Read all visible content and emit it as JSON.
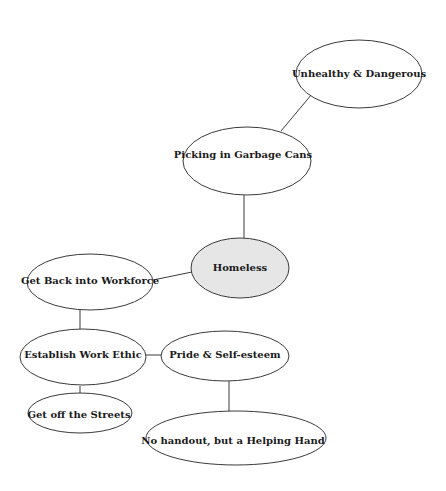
{
  "diagram": {
    "type": "concept-map",
    "nodes": [
      {
        "id": "unhealthy",
        "label": "Unhealthy & Dangerous"
      },
      {
        "id": "picking",
        "label": "Picking in Garbage Cans"
      },
      {
        "id": "homeless",
        "label": "Homeless",
        "central": true,
        "fill": "#e6e6e6"
      },
      {
        "id": "workforce",
        "label": "Get Back into Workforce"
      },
      {
        "id": "ethic",
        "label": "Establish Work Ethic"
      },
      {
        "id": "pride",
        "label": "Pride & Self-esteem"
      },
      {
        "id": "streets",
        "label": "Get off the Streets"
      },
      {
        "id": "handout",
        "label": "No handout, but a Helping Hand"
      }
    ],
    "edges": [
      [
        "picking",
        "unhealthy"
      ],
      [
        "homeless",
        "picking"
      ],
      [
        "homeless",
        "workforce"
      ],
      [
        "workforce",
        "ethic"
      ],
      [
        "ethic",
        "pride"
      ],
      [
        "ethic",
        "streets"
      ],
      [
        "pride",
        "handout"
      ]
    ]
  }
}
